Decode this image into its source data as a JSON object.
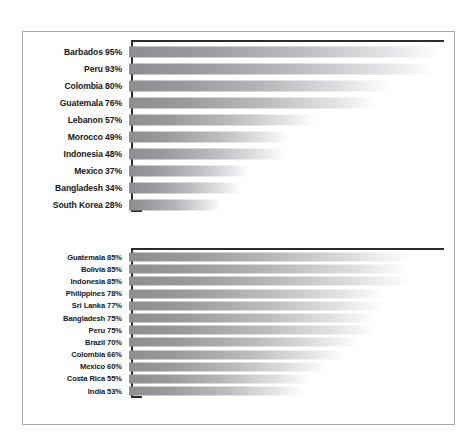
{
  "chart_data": [
    {
      "type": "bar",
      "orientation": "horizontal",
      "title": "",
      "xlabel": "",
      "ylabel": "",
      "xlim": [
        0,
        100
      ],
      "grid": false,
      "legend": null,
      "unit": "%",
      "categories": [
        "Barbados",
        "Peru",
        "Colombia",
        "Guatemala",
        "Lebanon",
        "Morocco",
        "Indonesia",
        "Mexico",
        "Bangladesh",
        "South Korea"
      ],
      "values": [
        95,
        93,
        80,
        76,
        57,
        49,
        48,
        37,
        34,
        28
      ],
      "labels": [
        "Barbados 95%",
        "Peru 93%",
        "Colombia 80%",
        "Guatemala 76%",
        "Lebanon 57%",
        "Morocco 49%",
        "Indonesia 48%",
        "Mexico 37%",
        "Bangladesh 34%",
        "South Korea 28%"
      ]
    },
    {
      "type": "bar",
      "orientation": "horizontal",
      "title": "",
      "xlabel": "",
      "ylabel": "",
      "xlim": [
        0,
        100
      ],
      "grid": false,
      "legend": null,
      "unit": "%",
      "categories": [
        "Guatemala",
        "Bolivia",
        "Indonesia",
        "Philippines",
        "Sri Lanka",
        "Bangladesh",
        "Peru",
        "Brazil",
        "Colombia",
        "Mexico",
        "Costa Rica",
        "India"
      ],
      "values": [
        85,
        85,
        85,
        78,
        77,
        75,
        75,
        70,
        66,
        60,
        55,
        53
      ],
      "labels": [
        "Guatemala 85%",
        "Bolivia 85%",
        "Indonesia 85%",
        "Philippines 78%",
        "Sri Lanka 77%",
        "Bangladesh 75%",
        "Peru 75%",
        "Brazil 70%",
        "Colombia 66%",
        "Mexico 60%",
        "Costa Rica 55%",
        "India 53%"
      ]
    }
  ],
  "style": {
    "bar_start_color": "#8e8e92",
    "bar_end_color": "#ffffff",
    "axis_color": "#2c2c2e",
    "frame_color": "#a8a8ac",
    "label_color": "#16161a",
    "background": "#ffffff"
  }
}
